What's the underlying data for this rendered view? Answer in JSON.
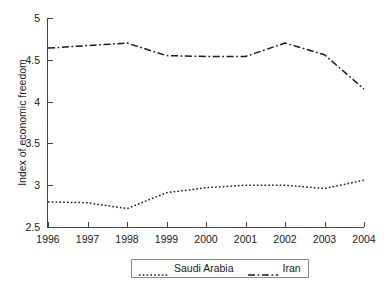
{
  "chart_data": {
    "type": "line",
    "title": "",
    "xlabel": "",
    "ylabel": "Index of economic freedom",
    "x": [
      1996,
      1997,
      1998,
      1999,
      2000,
      2001,
      2002,
      2003,
      2004
    ],
    "xticklabels": [
      "1996",
      "1997",
      "1998",
      "1999",
      "2000",
      "2001",
      "2002",
      "2003",
      "2004"
    ],
    "xlim": [
      1996,
      2004
    ],
    "ylim": [
      2.5,
      5
    ],
    "yticks": [
      2.5,
      3,
      3.5,
      4,
      4.5,
      5
    ],
    "yticklabels": [
      "2.5",
      "3",
      "3.5",
      "4",
      "4.5",
      "5"
    ],
    "grid": false,
    "legend_position": "below-center",
    "series": [
      {
        "name": "Saudi Arabia",
        "linestyle": "dotted",
        "color": "#1a1a1a",
        "values": [
          2.8,
          2.79,
          2.72,
          2.91,
          2.97,
          3.0,
          3.0,
          2.96,
          3.06
        ]
      },
      {
        "name": "Iran",
        "linestyle": "dash-dot",
        "color": "#1a1a1a",
        "values": [
          4.64,
          4.67,
          4.7,
          4.55,
          4.54,
          4.54,
          4.7,
          4.56,
          4.15
        ]
      }
    ]
  },
  "legend": {
    "entries": [
      {
        "label": "Saudi Arabia",
        "sample": "dotted-line-sample"
      },
      {
        "label": "Iran",
        "sample": "dash-dot-line-sample"
      }
    ]
  }
}
